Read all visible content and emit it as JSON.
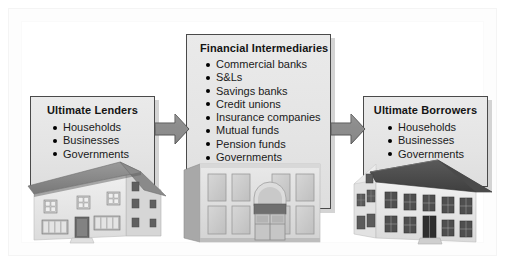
{
  "diagram": {
    "title_hidden": "",
    "nodes": [
      {
        "id": "ultimate-lenders",
        "title": "Ultimate Lenders",
        "items": [
          "Households",
          "Businesses",
          "Governments"
        ],
        "building": "house-suburban"
      },
      {
        "id": "financial-intermediaries",
        "title": "Financial Intermediaries",
        "items": [
          "Commercial banks",
          "S&Ls",
          "Savings banks",
          "Credit unions",
          "Insurance companies",
          "Mutual funds",
          "Pension funds",
          "Governments"
        ],
        "building": "bank-classical"
      },
      {
        "id": "ultimate-borrowers",
        "title": "Ultimate Borrowers",
        "items": [
          "Households",
          "Businesses",
          "Governments"
        ],
        "building": "house-colonial"
      }
    ],
    "arrows": [
      {
        "id": "arrow-lenders-to-intermediaries",
        "direction": "right"
      },
      {
        "id": "arrow-intermediaries-to-borrowers",
        "direction": "right"
      }
    ],
    "colors": {
      "box_fill": "#e6e6e6",
      "box_border": "#4a4a4a",
      "arrow_fill": "#8c8c8c",
      "arrow_border": "#4f4f4f",
      "text": "#141414",
      "page_background": "#ffffff"
    }
  }
}
